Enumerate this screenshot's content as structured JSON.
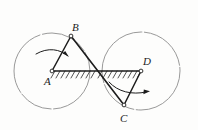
{
  "figure": {
    "kind": "kinematic-linkage-diagram",
    "background_color": "#fdfdfc",
    "ink_color": "#1c1c1c",
    "circle_color": "#8a8a8a",
    "labels": [
      {
        "id": "A",
        "text": "A",
        "x": 44,
        "y": 76
      },
      {
        "id": "B",
        "text": "B",
        "x": 72,
        "y": 22
      },
      {
        "id": "C",
        "text": "C",
        "x": 120,
        "y": 113
      },
      {
        "id": "D",
        "text": "D",
        "x": 143,
        "y": 56
      }
    ],
    "points": {
      "A": {
        "x": 52,
        "y": 71
      },
      "B": {
        "x": 71,
        "y": 36
      },
      "C": {
        "x": 124,
        "y": 105
      },
      "D": {
        "x": 141,
        "y": 71
      },
      "crossing": {
        "x": 96,
        "y": 71
      }
    },
    "circles": [
      {
        "id": "left-circle",
        "cx": 52,
        "cy": 71,
        "r": 38
      },
      {
        "id": "right-circle",
        "cx": 141,
        "cy": 71,
        "r": 39
      }
    ],
    "links": [
      {
        "id": "link-AB",
        "from": "A",
        "to": "B"
      },
      {
        "id": "link-BC",
        "from": "B",
        "to": "C"
      },
      {
        "id": "link-CD",
        "from": "C",
        "to": "D"
      },
      {
        "id": "ground-AD",
        "from": "A",
        "to": "D"
      }
    ],
    "hatching": [
      {
        "id": "left-ground-hatch",
        "x_start": 52,
        "x_end": 96,
        "y": 71
      },
      {
        "id": "right-ground-hatch",
        "x_start": 97,
        "x_end": 141,
        "y": 71
      }
    ],
    "rotation_arrows": [
      {
        "id": "left-rotation-arrow",
        "direction": "clockwise"
      },
      {
        "id": "right-rotation-arrow",
        "direction": "clockwise"
      }
    ]
  }
}
